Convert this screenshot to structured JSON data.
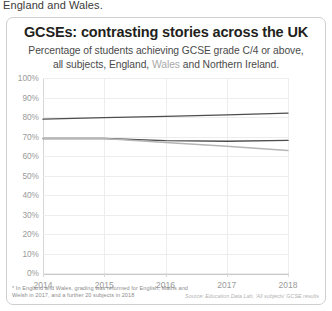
{
  "page": {
    "preceding_text": "England and Wales."
  },
  "card": {
    "title": "GCSEs: contrasting stories across the UK",
    "subtitle_line1": "Percentage of students achieving GCSE grade C/4 or above,",
    "subtitle_line2_pre": "all subjects, England, ",
    "subtitle_line2_wales": "Wales",
    "subtitle_line2_post": " and Northern Ireland.",
    "footnote": "* In England and Wales, grading was reformed for English, Maths and Welsh in 2017, and a further 20 subjects in 2018",
    "source": "Source: Education Data Lab, 'All subjects' GCSE results"
  },
  "colors": {
    "northern_ireland": "#4d4d4d",
    "england": "#4d4d4d",
    "wales": "#b5b5b5",
    "grid": "#ededed",
    "axis": "#cbcbcb",
    "tick_label": "#9a9a9a",
    "title": "#231f20"
  },
  "chart_data": {
    "type": "line",
    "title": "GCSEs: contrasting stories across the UK",
    "subtitle": "Percentage of students achieving GCSE grade C/4 or above, all subjects, England, Wales and Northern Ireland.",
    "xlabel": "",
    "ylabel": "",
    "x": [
      2014,
      2015,
      2016,
      2017,
      2018
    ],
    "xtick_labels": [
      "2014",
      "2015",
      "2016",
      "2017",
      "2018"
    ],
    "ytick_labels": [
      "0%",
      "10%",
      "20%",
      "30%",
      "40%",
      "50%",
      "60%",
      "70%",
      "80%",
      "90%",
      "100%"
    ],
    "ytick_values": [
      0,
      10,
      20,
      30,
      40,
      50,
      60,
      70,
      80,
      90,
      100
    ],
    "ylim": [
      0,
      100
    ],
    "xlim": [
      2014,
      2018
    ],
    "grid": true,
    "legend": "none",
    "series": [
      {
        "name": "Northern Ireland",
        "color": "#4d4d4d",
        "width": 1.4,
        "values": [
          78.9,
          79.7,
          80.3,
          81.1,
          82.0
        ]
      },
      {
        "name": "England",
        "color": "#4d4d4d",
        "width": 1.4,
        "values": [
          69.0,
          69.0,
          67.9,
          67.6,
          68.0
        ]
      },
      {
        "name": "Wales",
        "color": "#b5b5b5",
        "width": 1.4,
        "values": [
          69.0,
          69.0,
          66.9,
          65.0,
          62.8
        ]
      }
    ]
  }
}
